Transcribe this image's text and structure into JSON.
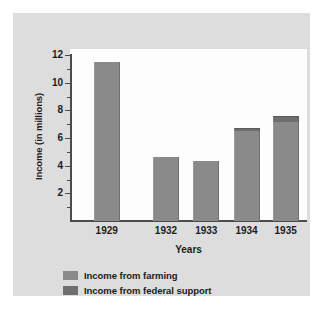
{
  "chart_data": {
    "type": "bar",
    "title": "",
    "subtitle": "",
    "xlabel": "Years",
    "ylabel": "Income (in millions)",
    "categories": [
      "1929",
      "1932",
      "1933",
      "1934",
      "1935"
    ],
    "ylim": [
      0,
      12
    ],
    "ytick_labels": [
      "2",
      "4",
      "6",
      "8",
      "10",
      "12"
    ],
    "ytick_values": [
      2,
      4,
      6,
      8,
      10,
      12
    ],
    "minor_ytick_values": [
      1,
      3,
      5,
      7,
      9,
      11
    ],
    "grid": false,
    "legend_position": "bottom-left",
    "stacked": true,
    "series": [
      {
        "name": "Income from farming",
        "color": "#8a8a8a",
        "values": [
          11.5,
          4.65,
          4.35,
          6.5,
          7.15
        ]
      },
      {
        "name": "Income from federal support",
        "color": "#6e6e6e",
        "values": [
          0,
          0,
          0,
          0.2,
          0.45
        ]
      }
    ],
    "totals": [
      11.5,
      4.65,
      4.35,
      6.7,
      7.6
    ],
    "bar_positions_pct": [
      15.5,
      40.5,
      57.5,
      74.5,
      91.0
    ]
  },
  "legend": {
    "items": [
      {
        "label": "Income from farming",
        "color": "#8a8a8a"
      },
      {
        "label": "Income from federal support",
        "color": "#6e6e6e"
      }
    ]
  },
  "colors": {
    "page_background": "#ffffff",
    "panel_background": "#dddddd",
    "plot_background": "#fdfdfd",
    "axis": "#4b4b4b",
    "text": "#1c1c1c",
    "farming_bar": "#8a8a8a",
    "federal_bar": "#6e6e6e"
  }
}
